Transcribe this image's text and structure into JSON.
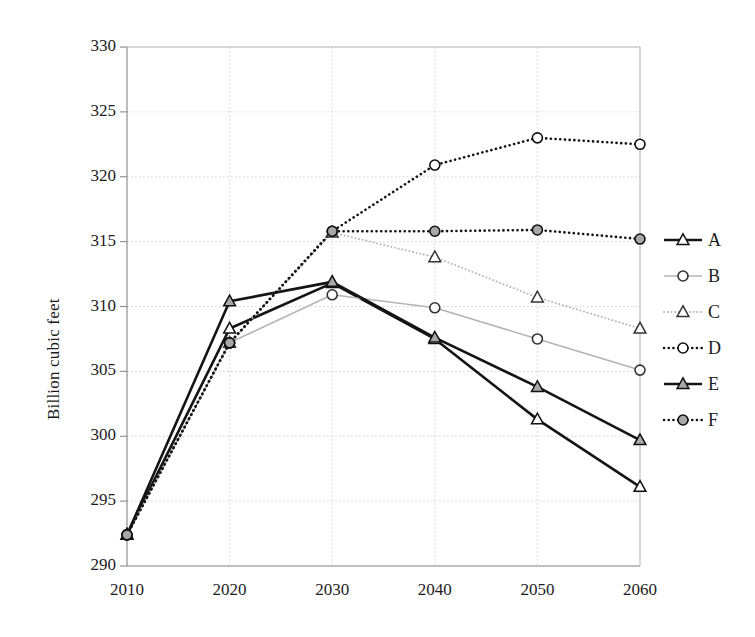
{
  "chart_data": {
    "type": "line",
    "title": "",
    "xlabel": "",
    "ylabel": "Billion cubic feet",
    "x": [
      2010,
      2020,
      2030,
      2040,
      2050,
      2060
    ],
    "xticklabels": [
      "2010",
      "2020",
      "2030",
      "2040",
      "2050",
      "2060"
    ],
    "yticklabels": [
      "290",
      "295",
      "300",
      "305",
      "310",
      "315",
      "320",
      "325",
      "330"
    ],
    "yticks": [
      290,
      295,
      300,
      305,
      310,
      315,
      320,
      325,
      330
    ],
    "xlim": [
      2010,
      2060
    ],
    "ylim": [
      290,
      330
    ],
    "grid": true,
    "legend_position": "right",
    "series": [
      {
        "name": "A",
        "values": [
          292.4,
          308.3,
          311.8,
          307.5,
          301.3,
          296.1
        ],
        "color": "#141414",
        "line_style": "solid",
        "line_width": 2.6,
        "marker": "triangle-open",
        "marker_fill": "#ffffff"
      },
      {
        "name": "B",
        "values": [
          292.4,
          307.2,
          310.9,
          309.9,
          307.5,
          305.1
        ],
        "color": "#b4b4b4",
        "line_style": "solid",
        "line_width": 1.6,
        "marker": "circle-open",
        "marker_fill": "#ffffff"
      },
      {
        "name": "C",
        "values": [
          292.4,
          307.2,
          315.7,
          313.8,
          310.7,
          308.3
        ],
        "color": "#b0b0b0",
        "line_style": "dotted",
        "line_width": 1.8,
        "marker": "triangle-open",
        "marker_fill": "#ffffff"
      },
      {
        "name": "D",
        "values": [
          292.4,
          307.2,
          315.8,
          320.9,
          323.0,
          322.5
        ],
        "color": "#141414",
        "line_style": "dotted",
        "line_width": 2.6,
        "marker": "circle-open",
        "marker_fill": "#ffffff"
      },
      {
        "name": "E",
        "values": [
          292.4,
          310.4,
          311.9,
          307.6,
          303.8,
          299.7
        ],
        "color": "#141414",
        "line_style": "solid",
        "line_width": 2.6,
        "marker": "triangle-filled",
        "marker_fill": "#a8a8a8"
      },
      {
        "name": "F",
        "values": [
          292.4,
          307.2,
          315.8,
          315.8,
          315.9,
          315.2
        ],
        "color": "#141414",
        "line_style": "dotted",
        "line_width": 2.6,
        "marker": "circle-filled",
        "marker_fill": "#a8a8a8"
      }
    ]
  },
  "legend": {
    "items": [
      {
        "label": "A"
      },
      {
        "label": "B"
      },
      {
        "label": "C"
      },
      {
        "label": "D"
      },
      {
        "label": "E"
      },
      {
        "label": "F"
      }
    ]
  },
  "colors": {
    "axis": "#8a8a8a",
    "grid": "#cccccc",
    "text": "#1c1c1c",
    "background": "#ffffff"
  }
}
